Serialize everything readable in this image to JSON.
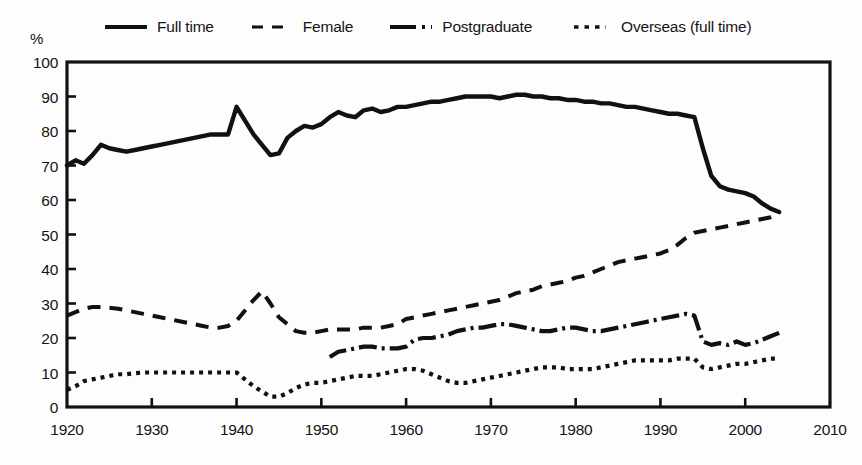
{
  "chart_data": {
    "type": "line",
    "title": "",
    "subtitle": "",
    "xlabel": "",
    "ylabel": "%",
    "xlim": [
      1920,
      2010
    ],
    "ylim": [
      0,
      100
    ],
    "grid": false,
    "legend_position": "top",
    "x_ticks": [
      "1920",
      "1930",
      "1940",
      "1950",
      "1960",
      "1970",
      "1980",
      "1990",
      "2000",
      "2010"
    ],
    "y_ticks": [
      "0",
      "10",
      "20",
      "30",
      "40",
      "50",
      "60",
      "70",
      "80",
      "90",
      "100"
    ],
    "series": [
      {
        "name": "Full time",
        "style": "solid",
        "color": "#111111",
        "x": [
          1920,
          1921,
          1922,
          1923,
          1924,
          1925,
          1926,
          1927,
          1928,
          1929,
          1930,
          1931,
          1932,
          1933,
          1934,
          1935,
          1936,
          1937,
          1938,
          1939,
          1940,
          1941,
          1942,
          1943,
          1944,
          1945,
          1946,
          1947,
          1948,
          1949,
          1950,
          1951,
          1952,
          1953,
          1954,
          1955,
          1956,
          1957,
          1958,
          1959,
          1960,
          1961,
          1962,
          1963,
          1964,
          1965,
          1966,
          1967,
          1968,
          1969,
          1970,
          1971,
          1972,
          1973,
          1974,
          1975,
          1976,
          1977,
          1978,
          1979,
          1980,
          1981,
          1982,
          1983,
          1984,
          1985,
          1986,
          1987,
          1988,
          1989,
          1990,
          1991,
          1992,
          1993,
          1994,
          1995,
          1996,
          1997,
          1998,
          1999,
          2000,
          2001,
          2002,
          2003,
          2004
        ],
        "values": [
          70.0,
          71.5,
          70.5,
          73.0,
          76.0,
          75.0,
          74.5,
          74.0,
          74.5,
          75.0,
          75.5,
          76.0,
          76.5,
          77.0,
          77.5,
          78.0,
          78.5,
          79.0,
          79.0,
          79.0,
          87.0,
          83.0,
          79.0,
          76.0,
          73.0,
          73.5,
          78.0,
          80.0,
          81.5,
          81.0,
          82.0,
          84.0,
          85.5,
          84.5,
          84.0,
          86.0,
          86.5,
          85.5,
          86.0,
          87.0,
          87.0,
          87.5,
          88.0,
          88.5,
          88.5,
          89.0,
          89.5,
          90.0,
          90.0,
          90.0,
          90.0,
          89.5,
          90.0,
          90.5,
          90.5,
          90.0,
          90.0,
          89.5,
          89.5,
          89.0,
          89.0,
          88.5,
          88.5,
          88.0,
          88.0,
          87.5,
          87.0,
          87.0,
          86.5,
          86.0,
          85.5,
          85.0,
          85.0,
          84.5,
          84.0,
          75.0,
          67.0,
          64.0,
          63.0,
          62.5,
          62.0,
          61.0,
          59.0,
          57.5,
          56.5
        ]
      },
      {
        "name": "Female",
        "style": "dashed",
        "color": "#111111",
        "x": [
          1920,
          1921,
          1922,
          1923,
          1924,
          1925,
          1926,
          1927,
          1928,
          1929,
          1930,
          1931,
          1932,
          1933,
          1934,
          1935,
          1936,
          1937,
          1938,
          1939,
          1940,
          1941,
          1942,
          1943,
          1944,
          1945,
          1946,
          1947,
          1948,
          1949,
          1950,
          1951,
          1952,
          1953,
          1954,
          1955,
          1956,
          1957,
          1958,
          1959,
          1960,
          1961,
          1962,
          1963,
          1964,
          1965,
          1966,
          1967,
          1968,
          1969,
          1970,
          1971,
          1972,
          1973,
          1974,
          1975,
          1976,
          1977,
          1978,
          1979,
          1980,
          1981,
          1982,
          1983,
          1984,
          1985,
          1986,
          1987,
          1988,
          1989,
          1990,
          1991,
          1992,
          1993,
          1994,
          1995,
          1996,
          1997,
          1998,
          1999,
          2000,
          2001,
          2002,
          2003,
          2004
        ],
        "values": [
          26.5,
          27.5,
          28.5,
          29.0,
          29.0,
          28.8,
          28.5,
          28.0,
          27.5,
          27.0,
          26.5,
          26.0,
          25.5,
          25.0,
          24.5,
          24.0,
          23.5,
          23.0,
          23.0,
          23.5,
          25.0,
          28.0,
          31.0,
          33.5,
          30.0,
          26.0,
          24.0,
          22.0,
          21.5,
          21.5,
          22.0,
          22.5,
          22.5,
          22.5,
          22.5,
          23.0,
          23.0,
          23.0,
          23.5,
          24.0,
          25.5,
          26.0,
          26.5,
          27.0,
          27.5,
          28.0,
          28.5,
          29.0,
          29.5,
          30.0,
          30.5,
          31.0,
          32.0,
          33.0,
          33.5,
          34.0,
          35.0,
          35.5,
          36.0,
          36.5,
          37.5,
          38.0,
          39.0,
          40.0,
          41.0,
          42.0,
          42.5,
          43.0,
          43.5,
          44.0,
          44.5,
          45.5,
          47.0,
          49.0,
          50.5,
          51.0,
          51.5,
          52.0,
          52.5,
          53.0,
          53.5,
          54.0,
          54.5,
          55.0,
          56.0
        ]
      },
      {
        "name": "Postgraduate",
        "style": "dash-dot",
        "color": "#111111",
        "x": [
          1951,
          1952,
          1953,
          1954,
          1955,
          1956,
          1957,
          1958,
          1959,
          1960,
          1961,
          1962,
          1963,
          1964,
          1965,
          1966,
          1967,
          1968,
          1969,
          1970,
          1971,
          1972,
          1973,
          1974,
          1975,
          1976,
          1977,
          1978,
          1979,
          1980,
          1981,
          1982,
          1983,
          1984,
          1985,
          1986,
          1987,
          1988,
          1989,
          1990,
          1991,
          1992,
          1993,
          1994,
          1995,
          1996,
          1997,
          1998,
          1999,
          2000,
          2001,
          2002,
          2003,
          2004
        ],
        "values": [
          14.5,
          16.0,
          16.5,
          17.0,
          17.5,
          17.5,
          17.0,
          17.0,
          17.0,
          17.5,
          19.5,
          20.0,
          20.0,
          20.5,
          21.0,
          22.0,
          22.5,
          23.0,
          23.0,
          23.5,
          24.0,
          24.0,
          23.5,
          23.0,
          22.5,
          22.0,
          22.0,
          22.5,
          23.0,
          23.0,
          22.5,
          22.0,
          22.0,
          22.5,
          23.0,
          23.5,
          24.0,
          24.5,
          25.0,
          25.5,
          26.0,
          26.5,
          27.0,
          26.5,
          19.0,
          18.0,
          18.5,
          18.0,
          19.0,
          18.0,
          18.5,
          19.5,
          20.5,
          21.5
        ]
      },
      {
        "name": "Overseas (full time)",
        "style": "dotted",
        "color": "#111111",
        "x": [
          1920,
          1921,
          1922,
          1923,
          1924,
          1925,
          1926,
          1927,
          1928,
          1929,
          1930,
          1931,
          1932,
          1933,
          1934,
          1935,
          1936,
          1937,
          1938,
          1939,
          1940,
          1941,
          1942,
          1943,
          1944,
          1945,
          1946,
          1947,
          1948,
          1949,
          1950,
          1951,
          1952,
          1953,
          1954,
          1955,
          1956,
          1957,
          1958,
          1959,
          1960,
          1961,
          1962,
          1963,
          1964,
          1965,
          1966,
          1967,
          1968,
          1969,
          1970,
          1971,
          1972,
          1973,
          1974,
          1975,
          1976,
          1977,
          1978,
          1979,
          1980,
          1981,
          1982,
          1983,
          1984,
          1985,
          1986,
          1987,
          1988,
          1989,
          1990,
          1991,
          1992,
          1993,
          1994,
          1995,
          1996,
          1997,
          1998,
          1999,
          2000,
          2001,
          2002,
          2003,
          2004
        ],
        "values": [
          5.0,
          6.0,
          7.5,
          8.0,
          8.5,
          9.0,
          9.5,
          9.5,
          9.8,
          10.0,
          10.0,
          10.0,
          10.0,
          10.0,
          10.0,
          10.0,
          10.0,
          10.0,
          10.0,
          10.0,
          10.0,
          8.0,
          6.0,
          4.5,
          3.0,
          3.0,
          4.0,
          5.5,
          6.5,
          7.0,
          7.0,
          7.5,
          8.0,
          8.5,
          9.0,
          9.0,
          9.0,
          9.5,
          10.0,
          10.5,
          11.0,
          11.0,
          10.5,
          9.5,
          8.5,
          7.5,
          7.0,
          7.0,
          7.5,
          8.0,
          8.5,
          9.0,
          9.5,
          10.0,
          10.5,
          11.0,
          11.5,
          11.5,
          11.5,
          11.0,
          11.0,
          11.0,
          11.0,
          11.5,
          12.0,
          12.5,
          13.0,
          13.5,
          13.5,
          13.5,
          13.5,
          13.5,
          14.0,
          14.0,
          14.0,
          11.5,
          11.0,
          11.5,
          12.0,
          12.5,
          12.5,
          13.0,
          13.5,
          14.0,
          14.0
        ]
      }
    ]
  },
  "legend": {
    "items": [
      {
        "label": "Full time",
        "style": "solid",
        "icon": "line-solid-icon"
      },
      {
        "label": "Female",
        "style": "dashed",
        "icon": "line-dashed-icon"
      },
      {
        "label": "Postgraduate",
        "style": "dash-dot",
        "icon": "line-dash-dot-icon"
      },
      {
        "label": "Overseas (full time)",
        "style": "dotted",
        "icon": "line-dotted-icon"
      }
    ]
  },
  "axes": {
    "y_unit_label": "%",
    "y_ticks": [
      "100",
      "90",
      "80",
      "70",
      "60",
      "50",
      "40",
      "30",
      "20",
      "10",
      "0"
    ],
    "x_ticks": [
      "1920",
      "1930",
      "1940",
      "1950",
      "1960",
      "1970",
      "1980",
      "1990",
      "2000",
      "2010"
    ]
  },
  "colors": {
    "ink": "#111111",
    "paper": "#fdfdfd"
  }
}
